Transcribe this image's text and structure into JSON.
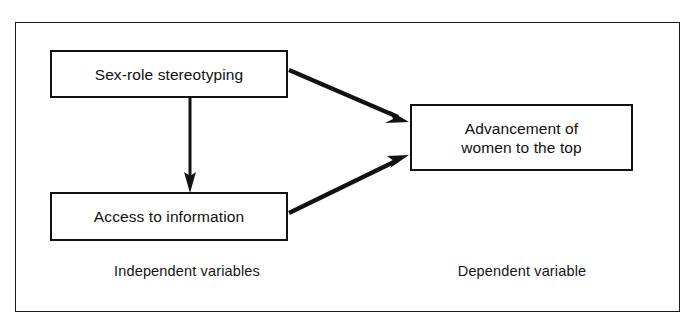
{
  "figure": {
    "clipped_caption_fragment": "",
    "frame": {
      "border_color": "#1a1a1a",
      "background_color": "#ffffff"
    }
  },
  "nodes": [
    {
      "id": "sex-role-stereotyping",
      "label": "Sex-role stereotyping",
      "group": "independent"
    },
    {
      "id": "access-to-information",
      "label": "Access to information",
      "group": "independent"
    },
    {
      "id": "advancement",
      "label": "Advancement of\nwomen to the top",
      "line1": "Advancement of",
      "line2": "women to the top",
      "group": "dependent"
    }
  ],
  "captions": {
    "independent": "Independent variables",
    "dependent": "Dependent variable"
  },
  "arrows": [
    {
      "id": "stereotyping-to-advancement",
      "from": "sex-role-stereotyping",
      "to": "advancement",
      "style": "solid-filled-head"
    },
    {
      "id": "stereotyping-to-access",
      "from": "sex-role-stereotyping",
      "to": "access-to-information",
      "style": "solid-filled-head"
    },
    {
      "id": "access-to-advancement",
      "from": "access-to-information",
      "to": "advancement",
      "style": "solid-filled-head"
    }
  ],
  "colors": {
    "ink": "#111111",
    "background": "#ffffff",
    "caption_grey": "#8d8d8d"
  }
}
